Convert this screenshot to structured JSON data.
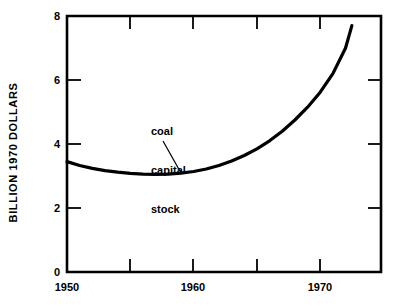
{
  "chart_data": {
    "type": "line",
    "title": "",
    "subtitle": "",
    "xlabel": "",
    "ylabel": "BILLION 1970 DOLLARS",
    "xlim": [
      1950,
      1974.8
    ],
    "ylim": [
      0,
      8
    ],
    "grid": false,
    "legend_position": "none",
    "x_tick_labels": [
      "1950",
      "1960",
      "1970"
    ],
    "x_tick_label_values": [
      1950,
      1960,
      1970
    ],
    "x_tick_values": [
      1955,
      1960,
      1965,
      1970
    ],
    "y_tick_labels": [
      "0",
      "2",
      "4",
      "6",
      "8"
    ],
    "y_tick_values": [
      0,
      2,
      4,
      6,
      8
    ],
    "annotations": [
      {
        "text_lines": [
          "coal",
          "capital",
          "stock"
        ],
        "text": "coal capital stock",
        "points_to_x": 1959,
        "points_to_y": 3.1
      }
    ],
    "series": [
      {
        "name": "coal capital stock",
        "color": "#000000",
        "x": [
          1950,
          1951,
          1952,
          1953,
          1954,
          1955,
          1956,
          1957,
          1958,
          1959,
          1960,
          1961,
          1962,
          1963,
          1964,
          1965,
          1966,
          1967,
          1968,
          1969,
          1970,
          1971,
          1972,
          1972.5
        ],
        "values": [
          3.45,
          3.33,
          3.24,
          3.17,
          3.12,
          3.08,
          3.06,
          3.05,
          3.06,
          3.09,
          3.14,
          3.22,
          3.33,
          3.47,
          3.64,
          3.85,
          4.1,
          4.4,
          4.75,
          5.15,
          5.62,
          6.2,
          7.0,
          7.7
        ]
      }
    ]
  },
  "axis": {
    "y_label": "BILLION 1970 DOLLARS",
    "y_ticks": [
      "8",
      "6",
      "4",
      "2",
      "0"
    ],
    "x_ticks": [
      "1950",
      "1960",
      "1970"
    ]
  },
  "annotation": {
    "line1": "coal",
    "line2": "capital",
    "line3": "stock"
  }
}
